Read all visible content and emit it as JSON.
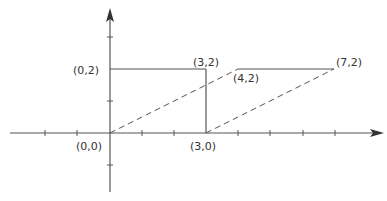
{
  "diagram": {
    "type": "coordinate-geometry",
    "colors": {
      "stroke": "#555555",
      "text": "#333333",
      "background": "#ffffff"
    },
    "labels": {
      "origin": "(0,0)",
      "p30": "(3,0)",
      "p02": "(0,2)",
      "p32": "(3,2)",
      "p42": "(4,2)",
      "p72": "(7,2)"
    },
    "points": [
      {
        "label": "(0,0)",
        "x": 0,
        "y": 0
      },
      {
        "label": "(3,0)",
        "x": 3,
        "y": 0
      },
      {
        "label": "(0,2)",
        "x": 0,
        "y": 2
      },
      {
        "label": "(3,2)",
        "x": 3,
        "y": 2
      },
      {
        "label": "(4,2)",
        "x": 4,
        "y": 2
      },
      {
        "label": "(7,2)",
        "x": 7,
        "y": 2
      }
    ],
    "solid_segments": [
      {
        "from": "(0,2)",
        "to": "(3,2)"
      },
      {
        "from": "(3,2)",
        "to": "(3,0)"
      },
      {
        "from": "(4,2)",
        "to": "(7,2)"
      }
    ],
    "dashed_segments": [
      {
        "from": "(0,0)",
        "to": "(4,2)"
      },
      {
        "from": "(3,0)",
        "to": "(7,2)"
      }
    ],
    "axes": {
      "x_ticks": [
        -2,
        -1,
        1,
        2,
        3,
        4,
        5,
        6,
        7
      ],
      "y_ticks": [
        -1,
        1,
        2,
        3
      ]
    }
  }
}
